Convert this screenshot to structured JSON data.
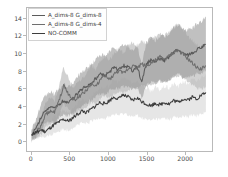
{
  "chart_data": {
    "type": "line",
    "title": "",
    "xlabel": "",
    "ylabel": "",
    "xlim": [
      -60,
      2360
    ],
    "ylim": [
      -1.2,
      15.2
    ],
    "xticks": [
      0,
      500,
      1000,
      1500,
      2000
    ],
    "yticks": [
      0,
      2,
      4,
      6,
      8,
      10,
      12,
      14
    ],
    "grid": false,
    "legend_position": "upper-left",
    "bands": "shaded confidence interval around each series",
    "series": [
      {
        "name": "A_dims-8 G_dims-8",
        "color": "#5a5a5a",
        "band_color": "#9a9a9a",
        "x": [
          0,
          60,
          120,
          180,
          240,
          300,
          360,
          420,
          480,
          540,
          600,
          660,
          720,
          780,
          840,
          900,
          960,
          1020,
          1080,
          1140,
          1200,
          1260,
          1320,
          1380,
          1440,
          1500,
          1560,
          1620,
          1680,
          1740,
          1800,
          1860,
          1920,
          1980,
          2040,
          2100,
          2160,
          2220,
          2280
        ],
        "values": [
          0.6,
          1.4,
          2.6,
          3.5,
          3.9,
          3.6,
          4.2,
          4.6,
          4.3,
          4.8,
          5.4,
          5.9,
          6.2,
          6.6,
          7.1,
          7.6,
          7.4,
          7.9,
          8.3,
          8.1,
          8.6,
          8.4,
          8.0,
          8.6,
          6.6,
          8.8,
          9.2,
          9.0,
          9.4,
          9.2,
          9.6,
          10.2,
          10.4,
          10.0,
          9.8,
          10.1,
          10.4,
          10.7,
          11.0
        ],
        "band_low": [
          0.0,
          0.4,
          1.3,
          2.0,
          2.3,
          2.1,
          2.6,
          2.9,
          2.8,
          3.2,
          3.6,
          4.0,
          4.3,
          4.6,
          5.0,
          5.4,
          5.3,
          5.7,
          6.0,
          5.9,
          6.2,
          6.1,
          5.8,
          6.2,
          4.8,
          6.4,
          6.7,
          6.5,
          6.8,
          6.7,
          7.0,
          7.4,
          7.6,
          7.3,
          7.2,
          7.4,
          7.6,
          7.8,
          8.1
        ],
        "band_high": [
          1.3,
          2.5,
          4.0,
          5.1,
          5.6,
          5.3,
          5.9,
          6.4,
          6.1,
          6.6,
          7.3,
          7.9,
          8.3,
          8.7,
          9.3,
          9.9,
          9.6,
          10.2,
          10.7,
          10.4,
          11.0,
          10.8,
          10.3,
          11.0,
          8.6,
          11.3,
          11.8,
          11.5,
          12.0,
          11.8,
          12.3,
          13.0,
          13.3,
          12.8,
          12.6,
          12.9,
          13.3,
          13.7,
          14.1
        ]
      },
      {
        "name": "A_dims-8 G_dims-4",
        "color": "#6e6e6e",
        "band_color": "#b4b4b4",
        "x": [
          0,
          60,
          120,
          180,
          240,
          300,
          360,
          420,
          480,
          540,
          600,
          660,
          720,
          780,
          840,
          900,
          960,
          1020,
          1080,
          1140,
          1200,
          1260,
          1320,
          1380,
          1440,
          1500,
          1560,
          1620,
          1680,
          1740,
          1800,
          1860,
          1920,
          1980,
          2040,
          2100,
          2160,
          2220,
          2280
        ],
        "values": [
          0.5,
          1.0,
          1.6,
          2.9,
          3.4,
          3.2,
          4.6,
          6.3,
          5.4,
          4.6,
          4.9,
          5.3,
          5.8,
          6.5,
          6.2,
          7.0,
          7.4,
          7.0,
          7.6,
          8.0,
          7.7,
          8.2,
          8.6,
          8.3,
          8.8,
          8.5,
          8.9,
          9.2,
          9.6,
          9.3,
          9.7,
          10.1,
          10.3,
          9.9,
          9.4,
          8.9,
          8.4,
          8.2,
          8.6
        ],
        "band_low": [
          -0.1,
          0.2,
          0.6,
          1.6,
          1.9,
          1.8,
          2.9,
          4.2,
          3.6,
          3.0,
          3.2,
          3.5,
          3.9,
          4.4,
          4.2,
          4.8,
          5.1,
          4.8,
          5.3,
          5.6,
          5.4,
          5.8,
          6.1,
          5.9,
          6.3,
          6.1,
          6.4,
          6.6,
          6.9,
          6.7,
          7.0,
          7.3,
          7.5,
          7.2,
          6.8,
          6.4,
          6.0,
          5.9,
          6.2
        ],
        "band_high": [
          1.1,
          1.9,
          2.7,
          4.2,
          4.9,
          4.6,
          6.3,
          8.4,
          7.2,
          6.2,
          6.6,
          7.1,
          7.7,
          8.6,
          8.2,
          9.2,
          9.7,
          9.2,
          10.0,
          10.5,
          10.1,
          10.7,
          11.2,
          10.8,
          11.4,
          11.0,
          11.5,
          11.9,
          12.4,
          12.0,
          12.5,
          13.0,
          13.3,
          12.8,
          12.1,
          11.5,
          10.9,
          10.6,
          11.1
        ]
      },
      {
        "name": "NO-COMM",
        "color": "#3c3c3c",
        "band_color": "#d6d6d6",
        "x": [
          0,
          60,
          120,
          180,
          240,
          300,
          360,
          420,
          480,
          540,
          600,
          660,
          720,
          780,
          840,
          900,
          960,
          1020,
          1080,
          1140,
          1200,
          1260,
          1320,
          1380,
          1440,
          1500,
          1560,
          1620,
          1680,
          1740,
          1800,
          1860,
          1920,
          1980,
          2040,
          2100,
          2160,
          2220,
          2280
        ],
        "values": [
          0.7,
          0.9,
          1.2,
          1.0,
          1.4,
          1.8,
          2.1,
          2.4,
          2.2,
          2.6,
          3.0,
          3.4,
          3.2,
          3.6,
          4.0,
          4.4,
          4.2,
          4.6,
          5.0,
          4.8,
          5.2,
          5.0,
          4.6,
          4.9,
          4.5,
          4.2,
          4.0,
          4.3,
          4.1,
          4.4,
          4.2,
          4.6,
          4.4,
          4.8,
          4.6,
          5.0,
          4.8,
          5.2,
          5.5
        ],
        "band_low": [
          0.2,
          0.3,
          0.5,
          0.3,
          0.6,
          0.9,
          1.1,
          1.3,
          1.2,
          1.5,
          1.8,
          2.0,
          1.9,
          2.2,
          2.4,
          2.7,
          2.5,
          2.8,
          3.0,
          2.9,
          3.1,
          3.0,
          2.7,
          2.9,
          2.6,
          2.4,
          2.3,
          2.5,
          2.4,
          2.6,
          2.4,
          2.7,
          2.6,
          2.8,
          2.7,
          2.9,
          2.8,
          3.1,
          3.3
        ],
        "band_high": [
          1.2,
          1.5,
          1.9,
          1.7,
          2.2,
          2.7,
          3.1,
          3.5,
          3.2,
          3.7,
          4.2,
          4.8,
          4.5,
          5.0,
          5.6,
          6.1,
          5.9,
          6.4,
          6.9,
          6.7,
          7.2,
          7.0,
          6.5,
          6.9,
          6.4,
          6.0,
          5.7,
          6.1,
          5.8,
          6.2,
          6.0,
          6.5,
          6.2,
          6.8,
          6.5,
          7.0,
          6.8,
          7.3,
          7.7
        ]
      }
    ]
  },
  "legend": {
    "items": [
      {
        "label": "A_dims-8 G_dims-8"
      },
      {
        "label": "A_dims-8 G_dims-4"
      },
      {
        "label": "NO-COMM"
      }
    ]
  }
}
